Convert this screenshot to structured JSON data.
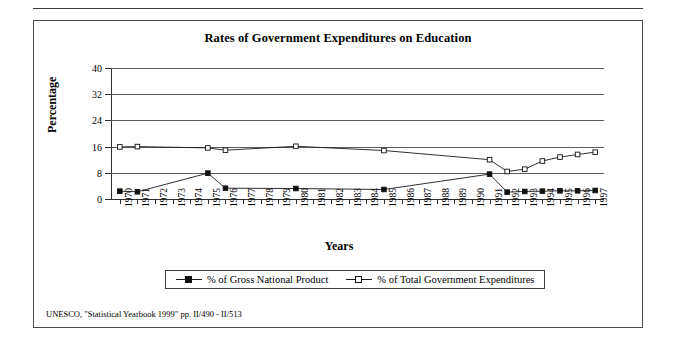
{
  "figure": {
    "title": "Rates of Government Expenditures on Education",
    "footnote": "UNESCO, \"Statistical Yearbook 1999\" pp. II/490 - II/513"
  },
  "chart_data": {
    "type": "line",
    "title": "Rates of Government Expenditures on Education",
    "xlabel": "Years",
    "ylabel": "Percentage",
    "ylim": [
      0,
      40
    ],
    "yticks": [
      0,
      8,
      16,
      24,
      32,
      40
    ],
    "grid": true,
    "legend_position": "bottom",
    "categories": [
      "1970",
      "1971",
      "1972",
      "1973",
      "1974",
      "1975",
      "1976",
      "1977",
      "1978",
      "1979",
      "1980",
      "1981",
      "1982",
      "1983",
      "1984",
      "1985",
      "1986",
      "1987",
      "1988",
      "1989",
      "1990",
      "1991",
      "1992",
      "1993",
      "1994",
      "1995",
      "1996",
      "1997"
    ],
    "series": [
      {
        "name": "% of Gross National Product",
        "marker": "filled-square",
        "values": [
          2.4,
          2.2,
          null,
          null,
          null,
          7.9,
          3.3,
          null,
          null,
          null,
          3.2,
          null,
          null,
          null,
          null,
          2.9,
          null,
          null,
          null,
          null,
          null,
          7.6,
          2.1,
          2.3,
          2.4,
          2.5,
          2.5,
          2.6
        ]
      },
      {
        "name": "% of Total Government Expenditures",
        "marker": "open-square",
        "values": [
          15.9,
          16.0,
          null,
          null,
          null,
          15.6,
          14.9,
          null,
          null,
          null,
          16.1,
          null,
          null,
          null,
          null,
          14.8,
          null,
          null,
          null,
          null,
          null,
          12.0,
          8.4,
          9.1,
          11.6,
          12.8,
          13.6,
          14.3
        ]
      }
    ]
  },
  "legend": {
    "entries": [
      {
        "label": "% of Gross National Product",
        "marker": "filled-square"
      },
      {
        "label": "% of Total Government Expenditures",
        "marker": "open-square"
      }
    ]
  }
}
